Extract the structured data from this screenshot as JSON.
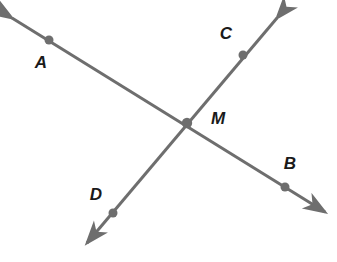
{
  "diagram": {
    "kind": "intersecting-lines-geometry-figure",
    "background_color": "#ffffff",
    "line_color": "#6e6e6e",
    "point_color": "#6e6e6e",
    "label_color": "#1a1a1a",
    "line_width": 3,
    "point_radius": 4.5,
    "lines": [
      {
        "name": "line-AB",
        "from_label": "A",
        "to_label": "B",
        "arrow_start": {
          "x": 12,
          "y": 18
        },
        "arrow_end": {
          "x": 325,
          "y": 212
        },
        "double_headed": true
      },
      {
        "name": "line-CD",
        "from_label": "C",
        "to_label": "D",
        "arrow_start": {
          "x": 277,
          "y": 18
        },
        "arrow_end": {
          "x": 87,
          "y": 243
        },
        "double_headed": true
      }
    ],
    "points": [
      {
        "id": "A",
        "label": "A",
        "x": 49,
        "y": 40,
        "label_x": 41,
        "label_y": 64
      },
      {
        "id": "C",
        "label": "C",
        "x": 243,
        "y": 55,
        "label_x": 226,
        "label_y": 35
      },
      {
        "id": "M",
        "label": "M",
        "x": 187,
        "y": 123,
        "label_x": 218,
        "label_y": 120
      },
      {
        "id": "B",
        "label": "B",
        "x": 285,
        "y": 187,
        "label_x": 290,
        "label_y": 165
      },
      {
        "id": "D",
        "label": "D",
        "x": 113,
        "y": 213,
        "label_x": 96,
        "label_y": 196
      }
    ],
    "labels": {
      "a": "A",
      "b": "B",
      "c": "C",
      "d": "D",
      "m": "M"
    }
  }
}
